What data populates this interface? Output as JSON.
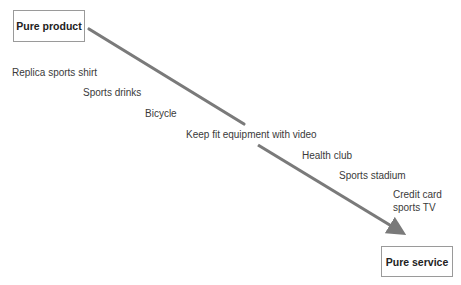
{
  "diagram": {
    "type": "continuum",
    "start_node": {
      "label": "Pure product"
    },
    "end_node": {
      "label": "Pure service"
    },
    "items": [
      {
        "label": "Replica sports shirt"
      },
      {
        "label": "Sports drinks"
      },
      {
        "label": "Bicycle"
      },
      {
        "label": "Keep fit equipment with video"
      },
      {
        "label": "Health club"
      },
      {
        "label": "Sports stadium"
      },
      {
        "label": "Credit card",
        "label2": "sports TV"
      }
    ],
    "arrow_color": "#7a7a7a",
    "border_color": "#9a9a9a"
  }
}
